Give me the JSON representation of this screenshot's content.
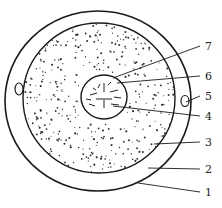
{
  "diagram": {
    "type": "cell-structure-cross-section",
    "stroke_color": "#1a1a1a",
    "background": "#ffffff",
    "labels": [
      {
        "num": "7",
        "y": 50,
        "tx": 113,
        "ty": 78
      },
      {
        "num": "6",
        "y": 80,
        "tx": 117,
        "ty": 83
      },
      {
        "num": "5",
        "y": 100,
        "tx": 186,
        "ty": 102
      },
      {
        "num": "4",
        "y": 120,
        "tx": 113,
        "ty": 106
      },
      {
        "num": "3",
        "y": 146,
        "tx": 154,
        "ty": 144
      },
      {
        "num": "2",
        "y": 173,
        "tx": 148,
        "ty": 168
      },
      {
        "num": "1",
        "y": 196,
        "tx": 138,
        "ty": 183
      }
    ]
  }
}
